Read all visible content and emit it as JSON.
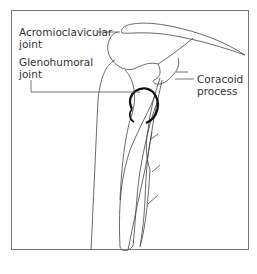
{
  "diagram": {
    "labels": {
      "acromioclavicular": "Acromioclavicular\njoint",
      "glenohumoral": "Glenohumoral\njoint",
      "coracoid": "Coracoid\nprocess"
    },
    "colors": {
      "line": "#444444",
      "joint": "#111111",
      "frame": "#777777"
    }
  }
}
